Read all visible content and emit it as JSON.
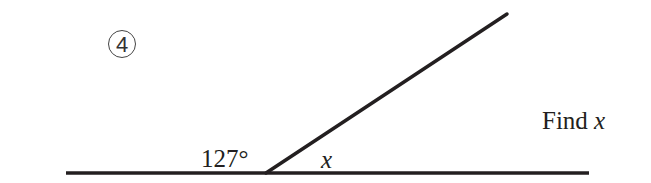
{
  "problem": {
    "number": "4",
    "number_display": "④",
    "instruction_text": "Find",
    "instruction_var": "x",
    "given_angle": "127°",
    "unknown_angle": "x"
  },
  "diagram": {
    "type": "supplementary-angles-on-straight-line",
    "line_color": "#231f20",
    "baseline": {
      "x1": 66,
      "y1": 173,
      "x2": 589,
      "y2": 173
    },
    "ray": {
      "x1": 266,
      "y1": 173,
      "x2": 507,
      "y2": 14
    },
    "vertex": {
      "x": 266,
      "y": 173
    }
  }
}
